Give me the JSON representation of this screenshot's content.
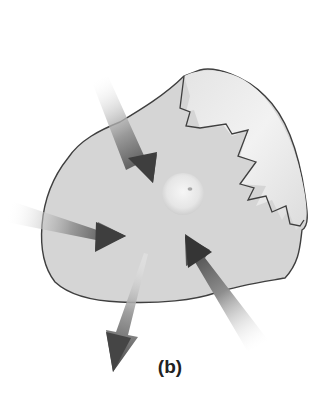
{
  "figure": {
    "caption": "(b)",
    "colors": {
      "cell_fill": "#d6d6d6",
      "torn_region_fill": "#ececec",
      "outline": "#3f3f3f",
      "nucleus_fill": "#e8e8e8",
      "arrow_dark": "#4a4a4a",
      "background": "#ffffff"
    },
    "arrows": [
      {
        "id": "arrow-in-top",
        "direction": "inward"
      },
      {
        "id": "arrow-in-left",
        "direction": "inward"
      },
      {
        "id": "arrow-in-bottom-right",
        "direction": "inward"
      },
      {
        "id": "arrow-out-bottom",
        "direction": "outward"
      }
    ]
  }
}
